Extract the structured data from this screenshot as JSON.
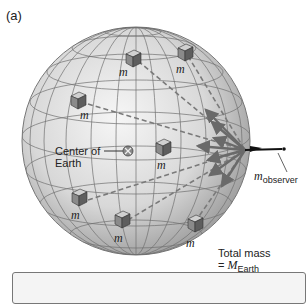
{
  "figure": {
    "panel_label": "(a)",
    "mass_label": "m",
    "center_label_line1": "Center of",
    "center_label_line2": "Earth",
    "observer_label_main": "m",
    "observer_label_sub": "observer",
    "total_mass_line1": "Total mass",
    "total_mass_eq": "= ",
    "total_mass_symbol": "M",
    "total_mass_sub": "Earth"
  },
  "colors": {
    "sphere_light": "#f2f2f2",
    "sphere_dark": "#9a9a9a",
    "grid": "#6e6e6e",
    "arrow": "#707070",
    "dash": "#7a7a7a",
    "cube_front": "#8a8a8a",
    "cube_side": "#5e5e5e",
    "cube_top": "#d0d0d0"
  },
  "masses": [
    {
      "x": 126,
      "y": 50
    },
    {
      "x": 182,
      "y": 50
    },
    {
      "x": 77,
      "y": 101
    },
    {
      "x": 162,
      "y": 147
    },
    {
      "x": 78,
      "y": 200
    },
    {
      "x": 122,
      "y": 220
    },
    {
      "x": 193,
      "y": 226
    }
  ]
}
